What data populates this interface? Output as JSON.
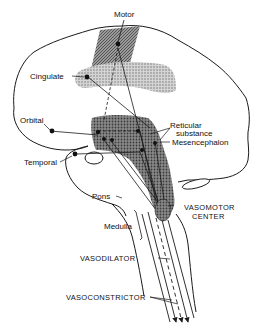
{
  "diagram": {
    "colors": {
      "line": "#1a1a1a",
      "stipple_light": "#b0b0b0",
      "stipple_dark": "#6e6e6e",
      "background": "#ffffff"
    },
    "labels": {
      "motor": "Motor",
      "cingulate": "Cingulate",
      "orbital": "Orbital",
      "temporal": "Temporal",
      "reticular_1": "Reticular",
      "reticular_2": "substance",
      "mesencephalon": "Mesencephalon",
      "pons": "Pons",
      "medulla": "Medulla",
      "vasomotor_1": "VASOMOTOR",
      "vasomotor_2": "CENTER",
      "vasodilator": "VASODILATOR",
      "vasoconstrictor": "VASOCONSTRICTOR"
    },
    "regions": [
      "motor-cortex",
      "cingulate-gyrus",
      "orbital-cortex",
      "temporal-lobe",
      "reticular-substance",
      "mesencephalon",
      "pons",
      "medulla",
      "vasomotor-center"
    ],
    "pathways": [
      "vasodilator",
      "vasoconstrictor"
    ]
  }
}
